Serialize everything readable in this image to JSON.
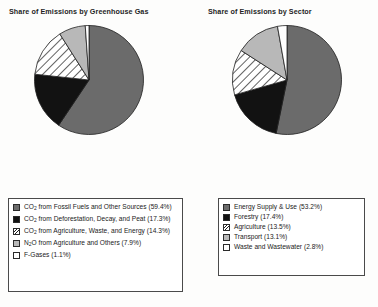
{
  "charts": [
    {
      "title": "Share of Emissions by Greenhouse Gas",
      "legend": [
        {
          "pattern": "solid-gray",
          "label": "CO2 from Fossil Fuels and Other Sources (59.4%)"
        },
        {
          "pattern": "solid-black",
          "label": "CO2 from Deforestation, Decay, and Peat (17.3%)"
        },
        {
          "pattern": "hatched",
          "label": "CO2 from Agriculture, Waste, and Energy (14.3%)"
        },
        {
          "pattern": "light-gray",
          "label": "N2O from Agriculture and Others (7.9%)"
        },
        {
          "pattern": "white",
          "label": "F-Gases (1.1%)"
        }
      ]
    },
    {
      "title": "Share of Emissions by Sector",
      "legend": [
        {
          "pattern": "solid-gray",
          "label": "Energy Supply & Use (53.2%)"
        },
        {
          "pattern": "solid-black",
          "label": "Forestry (17.4%)"
        },
        {
          "pattern": "hatched",
          "label": "Agriculture (13.5%)"
        },
        {
          "pattern": "light-gray",
          "label": "Transport (13.1%)"
        },
        {
          "pattern": "white",
          "label": "Waste and Wastewater (2.8%)"
        }
      ]
    }
  ],
  "chart_data": [
    {
      "type": "pie",
      "title": "Share of Emissions by Greenhouse Gas",
      "categories": [
        "CO2 from Fossil Fuels and Other Sources",
        "CO2 from Deforestation, Decay, and Peat",
        "CO2 from Agriculture, Waste, and Energy",
        "N2O from Agriculture and Others",
        "F-Gases"
      ],
      "values": [
        59.4,
        17.3,
        14.3,
        7.9,
        1.1
      ],
      "unit": "%",
      "start_angle_deg": 0,
      "direction": "clockwise",
      "legend_position": "below",
      "fills": [
        "#6b6b6b",
        "#121212",
        "hatch",
        "#b8b8b8",
        "#ffffff"
      ]
    },
    {
      "type": "pie",
      "title": "Share of Emissions by Sector",
      "categories": [
        "Energy Supply & Use",
        "Forestry",
        "Agriculture",
        "Transport",
        "Waste and Wastewater"
      ],
      "values": [
        53.2,
        17.4,
        13.5,
        13.1,
        2.8
      ],
      "unit": "%",
      "start_angle_deg": 0,
      "direction": "clockwise",
      "legend_position": "below",
      "fills": [
        "#6b6b6b",
        "#121212",
        "hatch",
        "#b8b8b8",
        "#ffffff"
      ]
    }
  ],
  "colors": {
    "slice_gray": "#6b6b6b",
    "slice_black": "#121212",
    "slice_light_gray": "#b8b8b8",
    "slice_white": "#ffffff",
    "outline": "#1f1f1f",
    "legend_border": "#4a4a4a",
    "background": "#fdfdfc"
  }
}
